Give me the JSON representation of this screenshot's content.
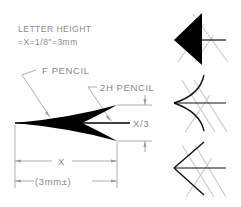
{
  "labels": {
    "letter_height_line1": "LETTER HEIGHT",
    "letter_height_line2": "=X=1/8\"=3mm",
    "f_pencil": "F PENCIL",
    "two_h_pencil": "2H PENCIL",
    "x_third": "X/3",
    "x_dim": "X",
    "x_dim_mm": "(3mm±)"
  },
  "examples": [
    {
      "name": "filled-triangle-arrowhead"
    },
    {
      "name": "curved-arrowhead"
    },
    {
      "name": "open-arrowhead"
    }
  ],
  "colors": {
    "ink": "#000000",
    "annotation": "#8a8a8a",
    "ghost_guide": "#c8c8c8"
  }
}
